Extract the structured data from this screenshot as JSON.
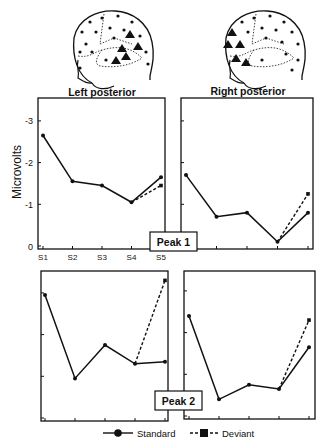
{
  "figure": {
    "regions": [
      {
        "id": "left",
        "label": "Left posterior"
      },
      {
        "id": "right",
        "label": "Right posterior"
      }
    ],
    "ylabel": "Microvolts",
    "yticks": [
      "-3",
      "-2",
      "-1",
      "0"
    ],
    "xticks": [
      "S1",
      "S2",
      "S3",
      "S4",
      "S5"
    ],
    "peaks": [
      {
        "label": "Peak 1"
      },
      {
        "label": "Peak 2"
      }
    ],
    "legend": [
      {
        "name": "Standard",
        "style": "solid",
        "marker": "circle"
      },
      {
        "name": "Deviant",
        "style": "dashed",
        "marker": "square"
      }
    ]
  },
  "chart_data": [
    {
      "type": "line",
      "title": "Left posterior - Peak 1",
      "xlabel": "",
      "ylabel": "Microvolts",
      "categories": [
        "S1",
        "S2",
        "S3",
        "S4",
        "S5"
      ],
      "ylim": [
        0,
        -3.5
      ],
      "series": [
        {
          "name": "Standard",
          "values": [
            -2.65,
            -1.55,
            -1.45,
            -1.05,
            -1.65
          ]
        },
        {
          "name": "Deviant",
          "values": [
            null,
            null,
            null,
            -1.05,
            -1.45
          ]
        }
      ]
    },
    {
      "type": "line",
      "title": "Right posterior - Peak 1",
      "xlabel": "",
      "ylabel": "Microvolts",
      "categories": [
        "S1",
        "S2",
        "S3",
        "S4",
        "S5"
      ],
      "ylim": [
        0,
        -3.5
      ],
      "series": [
        {
          "name": "Standard",
          "values": [
            -1.7,
            -0.7,
            -0.8,
            -0.1,
            -0.8
          ]
        },
        {
          "name": "Deviant",
          "values": [
            null,
            null,
            null,
            -0.1,
            -1.25
          ]
        }
      ]
    },
    {
      "type": "line",
      "title": "Left posterior - Peak 2",
      "xlabel": "",
      "ylabel": "Microvolts",
      "categories": [
        "S1",
        "S2",
        "S3",
        "S4",
        "S5"
      ],
      "ylim": [
        0,
        -3.5
      ],
      "series": [
        {
          "name": "Standard",
          "values": [
            -2.95,
            -0.95,
            -1.75,
            -1.3,
            -1.35
          ]
        },
        {
          "name": "Deviant",
          "values": [
            null,
            null,
            null,
            -1.3,
            -3.3
          ]
        }
      ]
    },
    {
      "type": "line",
      "title": "Right posterior - Peak 2",
      "xlabel": "",
      "ylabel": "Microvolts",
      "categories": [
        "S1",
        "S2",
        "S3",
        "S4",
        "S5"
      ],
      "ylim": [
        0,
        -3.5
      ],
      "series": [
        {
          "name": "Standard",
          "values": [
            -2.4,
            -0.4,
            -0.75,
            -0.65,
            -1.65
          ]
        },
        {
          "name": "Deviant",
          "values": [
            null,
            null,
            null,
            -0.65,
            -2.3
          ]
        }
      ]
    }
  ]
}
